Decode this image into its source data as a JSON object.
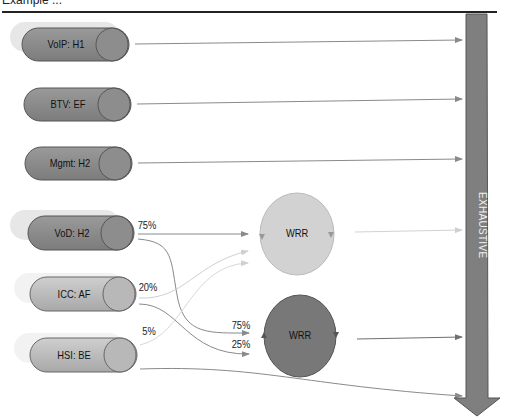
{
  "header": {
    "title": "Example ..."
  },
  "queues": [
    {
      "label": "VoIP: H1",
      "color": "#8a8a8a"
    },
    {
      "label": "BTV: EF",
      "color": "#8a8a8a"
    },
    {
      "label": "Mgmt: H2",
      "color": "#8a8a8a"
    },
    {
      "label": "VoD: H2",
      "color": "#8a8a8a"
    },
    {
      "label": "ICC: AF",
      "color": "#b5b5b5"
    },
    {
      "label": "HSI: BE",
      "color": "#b5b5b5"
    }
  ],
  "splits": {
    "vod_top": "75%",
    "icc_top": "20%",
    "hsi_top": "5%",
    "wrr2_in_a": "75%",
    "wrr2_in_b": "25%"
  },
  "schedulers": [
    {
      "label": "WRR",
      "color": "#d0d0d0"
    },
    {
      "label": "WRR",
      "color": "#7a7a7a"
    }
  ],
  "exhaustive": {
    "label": "EXHAUSTIVE",
    "color": "#7f7f7f"
  }
}
